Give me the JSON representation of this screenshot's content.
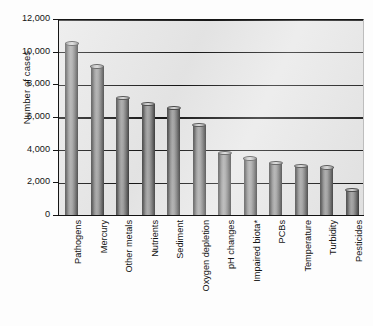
{
  "chart_data": {
    "type": "bar",
    "title": "",
    "xlabel": "",
    "ylabel": "Number of cases",
    "ylim": [
      0,
      12000
    ],
    "ytick_values": [
      0,
      2000,
      4000,
      6000,
      8000,
      10000,
      12000
    ],
    "ytick_labels": [
      "0",
      "2,000",
      "4,000",
      "6,000",
      "8,000",
      "10,000",
      "12,000"
    ],
    "grid": "horizontal",
    "legend": "none",
    "orientation": "vertical",
    "bar_style": "3d-cylinder-gray",
    "xtick_label_rotation": -90,
    "annotations": [
      "*"
    ],
    "categories": [
      "Pathogens",
      "Mercury",
      "Other metals",
      "Nutrients",
      "Sediment",
      "Oxygen depletion",
      "pH changes",
      "Impaired biota*",
      "PCBs",
      "Temperature",
      "Turbidity",
      "Pesticides"
    ],
    "values": [
      10500,
      9100,
      7150,
      6800,
      6550,
      5500,
      3800,
      3450,
      3200,
      3000,
      2900,
      1550
    ]
  },
  "colors": {
    "plot_background": "#e7e7e7",
    "page_background": "#fdfdfd",
    "gridline": "#161616",
    "axis": "#121212",
    "bar_dark": "#4e4e4e",
    "bar_light": "#a9a9a9",
    "bar_cap": "#d6d6d6",
    "text": "#141414"
  }
}
